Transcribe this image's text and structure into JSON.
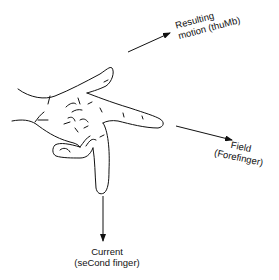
{
  "diagram": {
    "labels": {
      "thumb": {
        "line1": "Resulting",
        "line2": "motion (thuMb)"
      },
      "forefinger": {
        "line1": "Field",
        "line2": "(Forefinger)"
      },
      "second_finger": {
        "line1": "Current",
        "line2": "(seCond finger)"
      }
    },
    "arrows": [
      {
        "name": "motion",
        "from": [
          128,
          52
        ],
        "to": [
          170,
          33
        ]
      },
      {
        "name": "field",
        "from": [
          176,
          126
        ],
        "to": [
          232,
          140
        ]
      },
      {
        "name": "current",
        "from": [
          103,
          196
        ],
        "to": [
          103,
          241
        ]
      }
    ],
    "colors": {
      "stroke": "#111111",
      "background": "#ffffff"
    }
  }
}
